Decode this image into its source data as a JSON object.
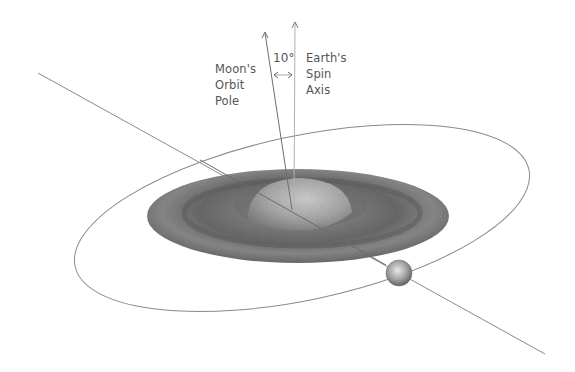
{
  "diagram": {
    "labels": {
      "moon_orbit_pole": [
        "Moon's",
        "Orbit",
        "Pole"
      ],
      "earth_spin_axis": [
        "Earth's",
        "Spin",
        "Axis"
      ],
      "angle": "10°"
    },
    "elements": {
      "earth_disk": "Earth with tidal bulge disk (shaded gray)",
      "moon": "Moon sphere on orbit",
      "moon_orbit": "Elliptical orbit path",
      "orbital_line": "Line through Earth and Moon"
    },
    "colors": {
      "line": "#8a8a8a",
      "disk_dark": "#5a5a5a",
      "disk_light": "#b8b8b8",
      "text": "#555555"
    }
  }
}
